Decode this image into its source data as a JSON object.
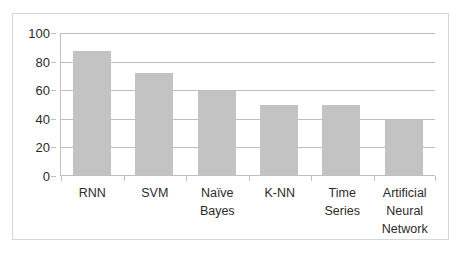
{
  "chart_data": {
    "type": "bar",
    "title": "",
    "subtitle": "",
    "xlabel": "",
    "ylabel": "",
    "categories": [
      "RNN",
      "SVM",
      "Naïve\nBayes",
      "K-NN",
      "Time Series",
      "Artificial\nNeural\nNetwork"
    ],
    "values": [
      87,
      72,
      59,
      49,
      49,
      39
    ],
    "ylim": [
      0,
      100
    ],
    "ytick_labels": [
      "100",
      "80",
      "60",
      "40",
      "20",
      "0"
    ],
    "ytick_values": [
      100,
      80,
      60,
      40,
      20,
      0
    ],
    "grid": true,
    "legend": false,
    "legend_position": "none",
    "series": [
      {
        "name": "",
        "values": [
          87,
          72,
          59,
          49,
          49,
          39
        ]
      }
    ],
    "colors": {
      "bar": "#c3c3c3",
      "gridline": "#bfbfbf",
      "axis": "#bfbfbf",
      "frame_border": "#d6d6d6",
      "text": "#2b2b2b",
      "background": "#ffffff"
    }
  }
}
